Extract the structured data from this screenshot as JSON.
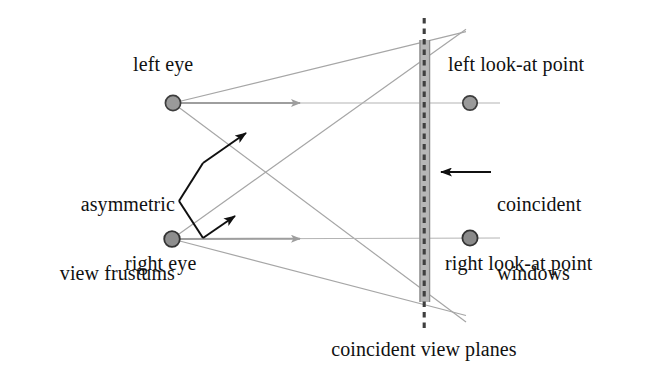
{
  "figure": {
    "caption": "coincident view planes",
    "labels": {
      "left_eye": "left eye",
      "right_eye": "right eye",
      "left_look_at": "left look-at point",
      "right_look_at": "right look-at point",
      "asymmetric_frustums_line1": "asymmetric",
      "asymmetric_frustums_line2": "view frustums",
      "coincident_windows_line1": "coincident",
      "coincident_windows_line2": "windows",
      "coincident_view_planes": "coincident view planes"
    },
    "colors": {
      "text": "#111111",
      "eye_dot_fill": "#9a9a9a",
      "eye_dot_stroke": "#3d3d3d",
      "lookat_dot_fill": "#8c8c8c",
      "lookat_dot_stroke": "#3a3a3a",
      "frustum_line": "#a6a6a6",
      "gaze_line": "#9e9e9e",
      "window_band_fill": "#b3b3b3",
      "window_band_edge": "#8f8f8f",
      "dashed_plane": "#4a4a4a",
      "annotation_arrow": "#101010"
    },
    "geometry": {
      "left_eye_point": [
        173,
        103
      ],
      "right_eye_point": [
        172,
        239
      ],
      "left_look_at_point": [
        470,
        103
      ],
      "right_look_at_point": [
        470,
        238
      ],
      "top_apex": [
        422,
        40
      ],
      "bottom_apex": [
        422,
        302
      ],
      "window_band_x_range": [
        419,
        430
      ],
      "window_band_y_range": [
        40,
        302
      ],
      "view_plane_dashed_x": 424,
      "view_plane_dashed_y_range": [
        18,
        330
      ]
    }
  }
}
